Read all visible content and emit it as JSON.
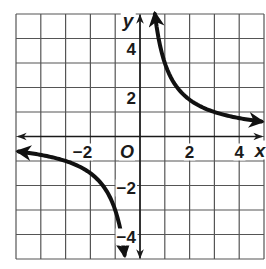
{
  "chart_data": {
    "type": "line",
    "title": "",
    "function": "y = 3/x",
    "xlabel": "x",
    "ylabel": "y",
    "origin_label": "O",
    "xlim": [
      -5,
      5
    ],
    "ylim": [
      -5,
      5
    ],
    "grid": true,
    "grid_step": 1,
    "x_ticks": [
      {
        "value": -2,
        "label": "−2"
      },
      {
        "value": 2,
        "label": "2"
      },
      {
        "value": 4,
        "label": "4"
      }
    ],
    "y_ticks": [
      {
        "value": 4,
        "label": "4"
      },
      {
        "value": 2,
        "label": "2"
      },
      {
        "value": -2,
        "label": "−2"
      },
      {
        "value": -4,
        "label": "−4"
      }
    ],
    "series": [
      {
        "name": "upper-branch",
        "x": [
          0.6,
          0.75,
          1,
          1.5,
          2,
          2.5,
          3,
          3.5,
          4,
          4.5,
          4.9
        ],
        "y": [
          5,
          4,
          3,
          2,
          1.5,
          1.2,
          1,
          0.86,
          0.75,
          0.67,
          0.61
        ]
      },
      {
        "name": "lower-branch",
        "x": [
          -4.9,
          -4.5,
          -4,
          -3.5,
          -3,
          -2.5,
          -2,
          -1.5,
          -1,
          -0.75,
          -0.62
        ],
        "y": [
          -0.61,
          -0.67,
          -0.75,
          -0.86,
          -1,
          -1.2,
          -1.5,
          -2,
          -3,
          -4,
          -4.85
        ]
      }
    ],
    "colors": {
      "grid": "#555555",
      "axis": "#1a1a1a",
      "curve": "#111111",
      "background": "#ffffff"
    }
  }
}
